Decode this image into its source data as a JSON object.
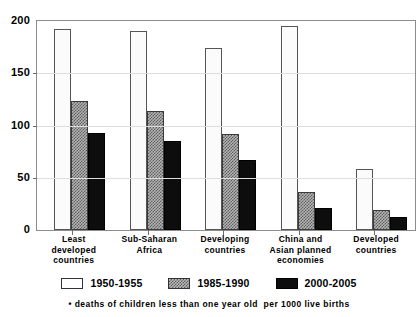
{
  "chart_data": {
    "type": "bar",
    "title": "",
    "subtitle": "",
    "xlabel": "",
    "ylabel": "",
    "ylim": [
      0,
      200
    ],
    "yticks": [
      0,
      50,
      100,
      150,
      200
    ],
    "ytick_labels": [
      "0",
      "50",
      "100",
      "150",
      "200"
    ],
    "grid": true,
    "legend_position": "bottom",
    "categories": [
      "Least\ndeveloped\ncountries",
      "Sub-Saharan\nAfrica",
      "Developing\ncountries",
      "China and\nAsian planned\neconomies",
      "Developed\ncountries"
    ],
    "category_lines": [
      [
        "Least",
        "developed",
        "countries"
      ],
      [
        "Sub-Saharan",
        "Africa"
      ],
      [
        "Developing",
        "countries"
      ],
      [
        "China and",
        "Asian planned",
        "economies"
      ],
      [
        "Developed",
        "countries"
      ]
    ],
    "series": [
      {
        "name": "1950-1955",
        "fill": "white",
        "color": "#ffffff",
        "values": [
          192,
          190,
          174,
          195,
          58
        ]
      },
      {
        "name": "1985-1990",
        "fill": "hatched-gray",
        "color": "#b3b3b3",
        "values": [
          123,
          114,
          92,
          36,
          19
        ]
      },
      {
        "name": "2000-2005",
        "fill": "black",
        "color": "#0d0d0d",
        "values": [
          93,
          85,
          67,
          21,
          12
        ]
      }
    ],
    "annotations": [
      "• deaths of children less than one year old  per 1000 live births"
    ]
  },
  "footnote": {
    "text": "• deaths of children less than one year old  per 1000 live births"
  },
  "axis": {
    "frame_color": "#8c8c8c",
    "gridline_color": "#dedede"
  }
}
